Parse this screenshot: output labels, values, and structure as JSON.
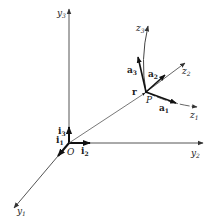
{
  "diagram": {
    "colors": {
      "line": "#333333",
      "text": "#222222",
      "background": "#ffffff"
    },
    "origin": {
      "label": "O"
    },
    "point": {
      "label": "P"
    },
    "position_vector": {
      "label": "r"
    },
    "fixed_axes": [
      {
        "name": "y",
        "sub": "1"
      },
      {
        "name": "y",
        "sub": "2"
      },
      {
        "name": "y",
        "sub": "3"
      }
    ],
    "fixed_unit_vectors": [
      {
        "name": "i",
        "sub": "1"
      },
      {
        "name": "i",
        "sub": "2"
      },
      {
        "name": "i",
        "sub": "3"
      }
    ],
    "moving_axes": [
      {
        "name": "z",
        "sub": "1"
      },
      {
        "name": "z",
        "sub": "2"
      },
      {
        "name": "z",
        "sub": "3"
      }
    ],
    "moving_unit_vectors": [
      {
        "name": "a",
        "sub": "1"
      },
      {
        "name": "a",
        "sub": "2"
      },
      {
        "name": "a",
        "sub": "3"
      }
    ]
  }
}
